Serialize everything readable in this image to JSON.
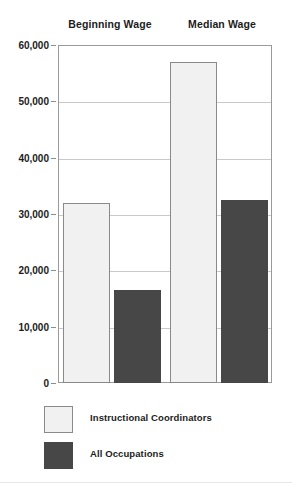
{
  "chart_data": {
    "type": "bar",
    "title": "",
    "subtitle": "",
    "xlabel": "",
    "ylabel": "",
    "categories": [
      "Beginning Wage",
      "Median Wage"
    ],
    "series": [
      {
        "name": "Instructional Coordinators",
        "color": "#f1f1f1",
        "values": [
          32000,
          57000
        ]
      },
      {
        "name": "All Occupations",
        "color": "#474747",
        "values": [
          16500,
          32500
        ]
      }
    ],
    "ylim": [
      0,
      60000
    ],
    "y_ticks": [
      0,
      10000,
      20000,
      30000,
      40000,
      50000,
      60000
    ],
    "y_tick_labels": [
      "0",
      "10,000",
      "20,000",
      "30,000",
      "40,000",
      "50,000",
      "60,000"
    ],
    "grid": true,
    "grid_axis": "y",
    "legend_position": "bottom-left"
  },
  "legend": {
    "entries": [
      {
        "label": "Instructional Coordinators",
        "swatch": "light"
      },
      {
        "label": "All Occupations",
        "swatch": "dark"
      }
    ]
  },
  "colors": {
    "series_light": "#f1f1f1",
    "series_dark": "#474747",
    "gridline": "#c9c9c9",
    "frame": "#9a9a9a",
    "text": "#1c1c1c"
  }
}
